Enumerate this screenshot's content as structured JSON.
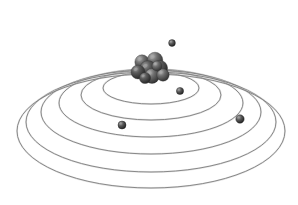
{
  "figure": {
    "style": "grayscale-shaded-3d-illustration",
    "background_color": "#ffffff",
    "caption": "",
    "canvas": {
      "width": 298,
      "height": 205
    }
  },
  "colors": {
    "orbit_stroke": "#7d7d7d",
    "orbit_stroke_light": "#c9c9c9",
    "nucleon_fill_dark": "#3b3b3b",
    "nucleon_fill_mid": "#5e5e5e",
    "nucleon_highlight": "#a8a8a8",
    "electron_fill": "#3a3a3a",
    "electron_highlight": "#9a9a9a",
    "background": "#ffffff"
  },
  "center": {
    "cx": 151,
    "cy": 103
  },
  "orbits": [
    {
      "name": "orbit-1",
      "shell": "K",
      "rx": 48,
      "ry": 16,
      "cy": 88,
      "label": "1"
    },
    {
      "name": "orbit-2",
      "shell": "L",
      "rx": 70,
      "ry": 25,
      "cy": 95,
      "label": "2"
    },
    {
      "name": "orbit-3",
      "shell": "M",
      "rx": 92,
      "ry": 34,
      "cy": 103,
      "label": "3"
    },
    {
      "name": "orbit-4",
      "shell": "N",
      "rx": 110,
      "ry": 42,
      "cy": 112,
      "label": "4"
    },
    {
      "name": "orbit-5",
      "shell": "O",
      "rx": 125,
      "ry": 50,
      "cy": 122,
      "label": "5"
    },
    {
      "name": "orbit-6",
      "shell": "P",
      "rx": 134,
      "ry": 57,
      "cy": 131,
      "label": "6"
    }
  ],
  "orbit_count": 6,
  "nucleus": {
    "name": "nucleus",
    "particle_count": 9,
    "particles": [
      {
        "x": 142,
        "y": 62,
        "r": 7.2,
        "shade": "mid"
      },
      {
        "x": 155,
        "y": 60,
        "r": 7.8,
        "shade": "mid"
      },
      {
        "x": 148,
        "y": 69,
        "r": 8.4,
        "shade": "dark"
      },
      {
        "x": 160,
        "y": 68,
        "r": 7.6,
        "shade": "dark"
      },
      {
        "x": 138,
        "y": 72,
        "r": 7.0,
        "shade": "dark"
      },
      {
        "x": 152,
        "y": 76,
        "r": 7.4,
        "shade": "mid"
      },
      {
        "x": 163,
        "y": 75,
        "r": 6.2,
        "shade": "mid"
      },
      {
        "x": 145,
        "y": 78,
        "r": 5.6,
        "shade": "dark"
      },
      {
        "x": 157,
        "y": 66,
        "r": 5.0,
        "shade": "mid"
      }
    ]
  },
  "electrons": [
    {
      "name": "electron-1",
      "x": 172,
      "y": 43,
      "r": 3.4,
      "on_orbit": "orbit-3"
    },
    {
      "name": "electron-2",
      "x": 180,
      "y": 91,
      "r": 3.6,
      "on_orbit": "orbit-1"
    },
    {
      "name": "electron-3",
      "x": 122,
      "y": 125,
      "r": 4.0,
      "on_orbit": "orbit-2"
    },
    {
      "name": "electron-4",
      "x": 240,
      "y": 119,
      "r": 4.2,
      "on_orbit": "orbit-4"
    }
  ],
  "electron_count": 4
}
